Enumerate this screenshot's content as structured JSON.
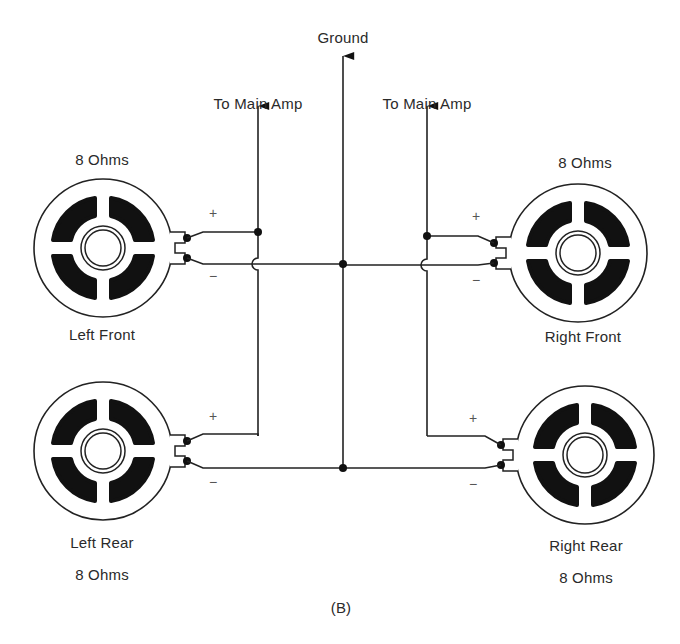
{
  "figure": {
    "caption": "(B)",
    "ground_label": "Ground",
    "amp_labels": {
      "left": "To Main Amp",
      "right": "To Main Amp"
    },
    "speakers": [
      {
        "id": "left-front",
        "name": "Left Front",
        "impedance": "8 Ohms"
      },
      {
        "id": "right-front",
        "name": "Right Front",
        "impedance": "8 Ohms"
      },
      {
        "id": "left-rear",
        "name": "Left Rear",
        "impedance": "8 Ohms"
      },
      {
        "id": "right-rear",
        "name": "Right Rear",
        "impedance": "8 Ohms"
      }
    ],
    "polarity": {
      "plus": "+",
      "minus": "−"
    }
  },
  "colors": {
    "line": "#222222",
    "background": "#ffffff"
  }
}
